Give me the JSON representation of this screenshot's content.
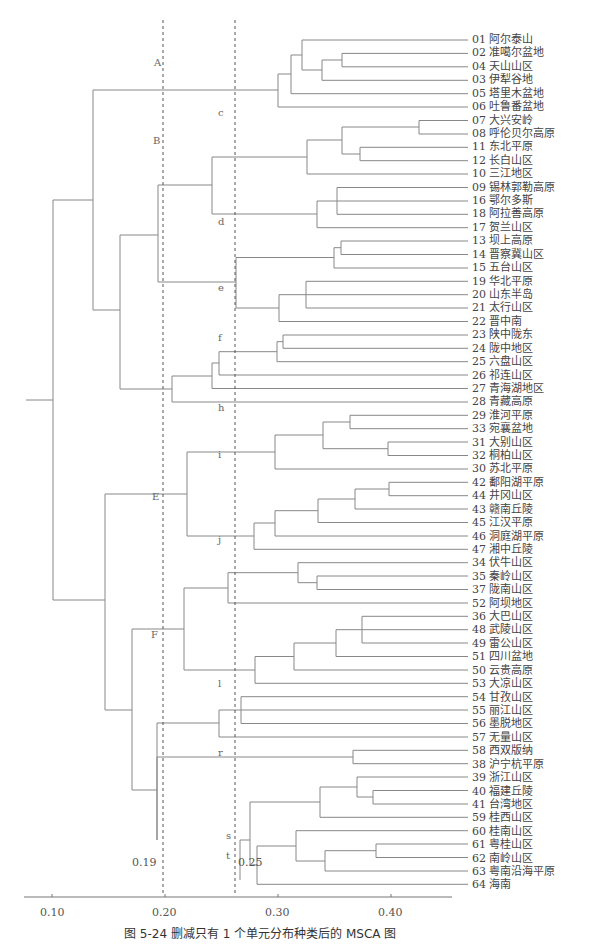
{
  "header": {
    "text": ""
  },
  "caption": "图 5-24   删减只有 1 个单元分布种类后的 MSCA 图",
  "axis": {
    "ticks": [
      {
        "label": "0.10",
        "x": 52
      },
      {
        "label": "0.20",
        "x": 165
      },
      {
        "label": "0.30",
        "x": 278
      },
      {
        "label": "0.40",
        "x": 391
      }
    ]
  },
  "thresholds": [
    {
      "label": "0.19",
      "x": 163
    },
    {
      "label": "0.25",
      "x": 235
    }
  ],
  "chart_data": {
    "type": "dendrogram",
    "title": "删减只有 1 个单元分布种类后的 MSCA 图",
    "figure_number": "图 5-24",
    "xlabel": "",
    "x_ticks": [
      "0.10",
      "0.20",
      "0.30",
      "0.40"
    ],
    "xlim": [
      0.07,
      0.48
    ],
    "threshold_lines": [
      0.19,
      0.25
    ],
    "cluster_labels_level1": [
      "A",
      "B",
      "E",
      "F"
    ],
    "cluster_labels_level2": [
      "c",
      "d",
      "e",
      "f",
      "h",
      "i",
      "j",
      "l",
      "r",
      "s",
      "t"
    ],
    "leaves": [
      "01 阿尔泰山",
      "02 准噶尔盆地",
      "04 天山山区",
      "03 伊犁谷地",
      "05 塔里木盆地",
      "06 吐鲁番盆地",
      "07 大兴安岭",
      "08 呼伦贝尔高原",
      "11 东北平原",
      "12 长白山区",
      "10 三江地区",
      "09 锡林郭勒高原",
      "16 鄂尔多斯",
      "18 阿拉善高原",
      "17 贺兰山区",
      "13 坝上高原",
      "14 晋察冀山区",
      "15 五台山区",
      "19 华北平原",
      "20 山东半岛",
      "21 太行山区",
      "22 晋中南",
      "23 陕中陇东",
      "24 陇中地区",
      "25 六盘山区",
      "26 祁连山区",
      "27 青海湖地区",
      "28 青藏高原",
      "29 淮河平原",
      "33 宛襄盆地",
      "31 大别山区",
      "32 桐柏山区",
      "30 苏北平原",
      "42 鄱阳湖平原",
      "44 井冈山区",
      "43 赣南丘陵",
      "45 江汉平原",
      "46 洞庭湖平原",
      "47 湘中丘陵",
      "34 伏牛山区",
      "35 秦岭山区",
      "37 陇南山区",
      "52 阿坝地区",
      "36 大巴山区",
      "48 武陵山区",
      "49 雷公山区",
      "51 四川盆地",
      "50 云贵高原",
      "53 大凉山区",
      "54 甘孜山区",
      "55 丽江山区",
      "56 墨脱地区",
      "57 无量山区",
      "58 西双版纳",
      "38 沪宁杭平原",
      "39 浙江山区",
      "40 福建丘陵",
      "41 台湾地区",
      "59 桂西山区",
      "60 桂南山区",
      "61 粤桂山区",
      "62 南岭山区",
      "63 粤南沿海平原",
      "64 海南"
    ]
  },
  "cluster_labels": [
    {
      "text": "A",
      "x": 154,
      "y": 63
    },
    {
      "text": "B",
      "x": 153,
      "y": 141
    },
    {
      "text": "c",
      "x": 218,
      "y": 113
    },
    {
      "text": "d",
      "x": 218,
      "y": 222
    },
    {
      "text": "e",
      "x": 218,
      "y": 288
    },
    {
      "text": "f",
      "x": 218,
      "y": 338
    },
    {
      "text": "h",
      "x": 218,
      "y": 408
    },
    {
      "text": "i",
      "x": 218,
      "y": 455
    },
    {
      "text": "E",
      "x": 152,
      "y": 497
    },
    {
      "text": "j",
      "x": 218,
      "y": 540
    },
    {
      "text": "F",
      "x": 151,
      "y": 635
    },
    {
      "text": "l",
      "x": 218,
      "y": 684
    },
    {
      "text": "r",
      "x": 218,
      "y": 753
    },
    {
      "text": "s",
      "x": 226,
      "y": 836
    },
    {
      "text": "t",
      "x": 226,
      "y": 856
    }
  ]
}
